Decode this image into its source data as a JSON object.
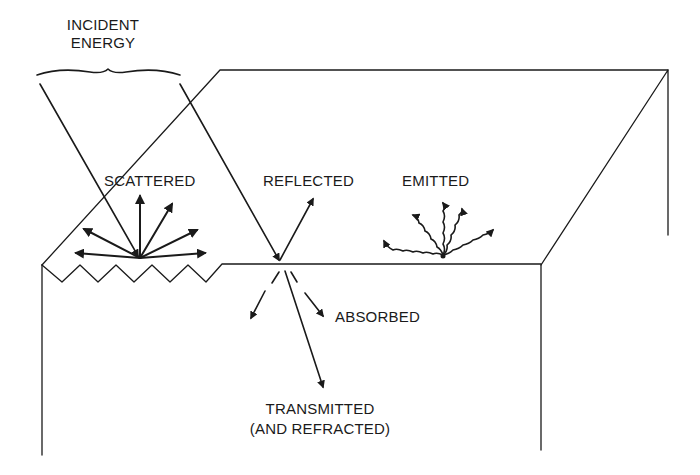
{
  "diagram": {
    "labels": {
      "incident_line1": "INCIDENT",
      "incident_line2": "ENERGY",
      "scattered": "SCATTERED",
      "reflected": "REFLECTED",
      "emitted": "EMITTED",
      "absorbed": "ABSORBED",
      "transmitted_line1": "TRANSMITTED",
      "transmitted_line2": "(AND REFRACTED)"
    },
    "colors": {
      "ink": "#1a1a1a",
      "background": "#ffffff"
    }
  }
}
